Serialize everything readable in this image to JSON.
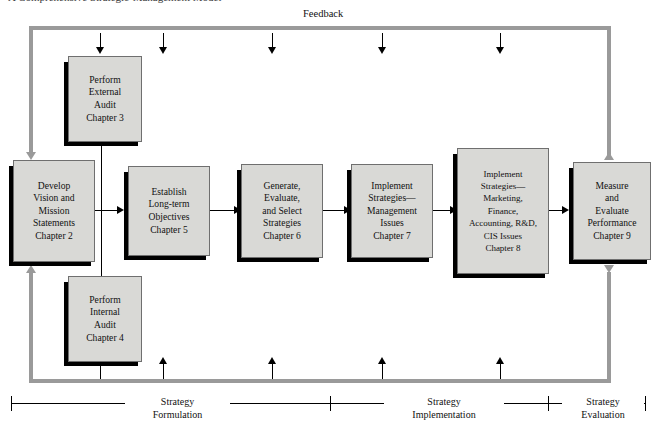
{
  "diagram": {
    "title_clipped": "A Comprehensive Strategic-Management Model",
    "feedback_label": "Feedback",
    "colors": {
      "box_fill": "#d9d9d6",
      "box_border": "#6f6f6f",
      "box_shadow": "#000000",
      "feedback_rail": "#9a9a9a",
      "connector": "#000000",
      "text": "#111111",
      "background": "#ffffff"
    },
    "boxes": [
      {
        "id": "external-audit",
        "lines": [
          "Perform",
          "External",
          "Audit",
          "Chapter 3"
        ],
        "chapter": "Chapter 3"
      },
      {
        "id": "vision-mission",
        "lines": [
          "Develop",
          "Vision and",
          "Mission",
          "Statements",
          "Chapter 2"
        ],
        "chapter": "Chapter 2"
      },
      {
        "id": "internal-audit",
        "lines": [
          "Perform",
          "Internal",
          "Audit",
          "Chapter 4"
        ],
        "chapter": "Chapter 4"
      },
      {
        "id": "long-term-objectives",
        "lines": [
          "Establish",
          "Long-term",
          "Objectives",
          "Chapter 5"
        ],
        "chapter": "Chapter 5"
      },
      {
        "id": "generate-select-strategies",
        "lines": [
          "Generate,",
          "Evaluate,",
          "and Select",
          "Strategies",
          "Chapter 6"
        ],
        "chapter": "Chapter 6"
      },
      {
        "id": "implement-management",
        "lines": [
          "Implement",
          "Strategies—",
          "Management",
          "Issues",
          "Chapter 7"
        ],
        "chapter": "Chapter 7"
      },
      {
        "id": "implement-functional",
        "lines": [
          "Implement",
          "Strategies—",
          "Marketing,",
          "Finance,",
          "Accounting, R&D,",
          "CIS Issues",
          "Chapter 8"
        ],
        "chapter": "Chapter 8"
      },
      {
        "id": "measure-evaluate",
        "lines": [
          "Measure",
          "and",
          "Evaluate",
          "Performance",
          "Chapter 9"
        ],
        "chapter": "Chapter 9"
      }
    ],
    "phases": [
      {
        "id": "formulation",
        "lines": [
          "Strategy",
          "Formulation"
        ]
      },
      {
        "id": "implementation",
        "lines": [
          "Strategy",
          "Implementation"
        ]
      },
      {
        "id": "evaluation",
        "lines": [
          "Strategy",
          "Evaluation"
        ]
      }
    ]
  }
}
